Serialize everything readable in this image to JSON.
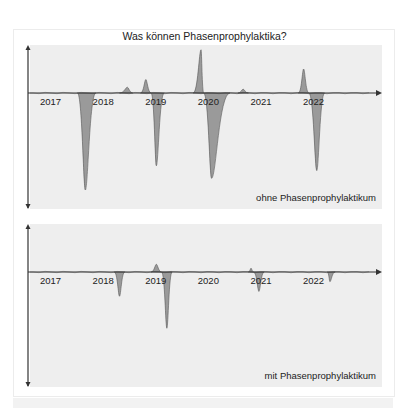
{
  "title": "Was können Phasenprophylaktika?",
  "colors": {
    "panel_bg": "#eeeeee",
    "fill": "#9a9a9a",
    "stroke": "#555555",
    "axis": "#333333",
    "text": "#222222"
  },
  "chart_data": [
    {
      "type": "area",
      "title": "Was können Phasenprophylaktika?",
      "panel_label": "ohne Phasenprophylaktikum",
      "xlabel": "",
      "ylabel": "",
      "x_ticks": [
        "2017",
        "2018",
        "2019",
        "2020",
        "2021",
        "2022"
      ],
      "ylim": [
        -1.0,
        0.5
      ],
      "grid": false,
      "note": "Stimmungsverlauf ohne Skala; positive Werte = (hypo)manische Phasen, negative = depressive Phasen",
      "episodes": [
        {
          "start": 2017.75,
          "peak": 2017.9,
          "end": 2018.1,
          "value": -1.0,
          "kind": "depression"
        },
        {
          "start": 2018.55,
          "peak": 2018.7,
          "end": 2018.8,
          "value": 0.06,
          "kind": "mild elevation"
        },
        {
          "start": 2018.95,
          "peak": 2019.05,
          "end": 2019.15,
          "value": 0.14,
          "kind": "elevation"
        },
        {
          "start": 2019.15,
          "peak": 2019.25,
          "end": 2019.4,
          "value": -0.75,
          "kind": "depression"
        },
        {
          "start": 2019.95,
          "peak": 2020.1,
          "end": 2020.15,
          "value": 0.45,
          "kind": "mania"
        },
        {
          "start": 2020.15,
          "peak": 2020.3,
          "end": 2020.65,
          "value": -0.88,
          "kind": "depression"
        },
        {
          "start": 2020.8,
          "peak": 2020.9,
          "end": 2021.0,
          "value": 0.04,
          "kind": "mild elevation"
        },
        {
          "start": 2021.95,
          "peak": 2022.05,
          "end": 2022.15,
          "value": 0.25,
          "kind": "hypomania"
        },
        {
          "start": 2022.15,
          "peak": 2022.3,
          "end": 2022.45,
          "value": -0.8,
          "kind": "depression"
        }
      ]
    },
    {
      "type": "area",
      "title": "",
      "panel_label": "mit Phasenprophylaktikum",
      "xlabel": "",
      "ylabel": "",
      "x_ticks": [
        "2017",
        "2018",
        "2019",
        "2020",
        "2021",
        "2022"
      ],
      "ylim": [
        -1.0,
        0.5
      ],
      "grid": false,
      "episodes": [
        {
          "start": 2018.45,
          "peak": 2018.55,
          "end": 2018.65,
          "value": -0.25,
          "kind": "mild depression"
        },
        {
          "start": 2019.15,
          "peak": 2019.25,
          "end": 2019.35,
          "value": 0.08,
          "kind": "mild elevation"
        },
        {
          "start": 2019.35,
          "peak": 2019.45,
          "end": 2019.55,
          "value": -0.58,
          "kind": "depression"
        },
        {
          "start": 2021.0,
          "peak": 2021.05,
          "end": 2021.1,
          "value": 0.04,
          "kind": "mild elevation"
        },
        {
          "start": 2021.1,
          "peak": 2021.2,
          "end": 2021.3,
          "value": -0.2,
          "kind": "mild depression"
        },
        {
          "start": 2022.5,
          "peak": 2022.55,
          "end": 2022.65,
          "value": -0.1,
          "kind": "mild depression"
        }
      ]
    }
  ]
}
